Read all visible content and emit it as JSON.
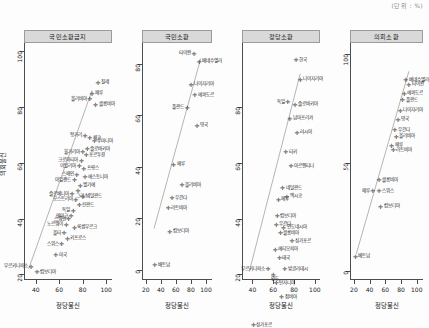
{
  "figure": {
    "corner_note": "(단위 : %)",
    "ylabel": "의회불신",
    "background": "#fdfdfd",
    "point_color": "#2b2b2b",
    "line_color": "#2b2b2b",
    "strip_fill": "#d9d9d9"
  },
  "chart_data": {
    "type": "scatter",
    "title": "",
    "xlabel": "정당불신",
    "ylabel": "의회불신",
    "grid": false,
    "legend": "none",
    "panels": [
      {
        "strip_label": "국민소환금지",
        "xlabel": "정당불신",
        "ylabel": "의회불신",
        "xlim": [
          30,
          105
        ],
        "ylim": [
          18,
          103
        ],
        "xticks": [
          40,
          60,
          80,
          100
        ],
        "yticks": [
          20,
          40,
          60,
          80,
          100
        ],
        "fit_line": {
          "x0": 34,
          "y0": 22,
          "x1": 88,
          "y1": 86
        },
        "points": [
          {
            "label": "칠레",
            "x": 93,
            "y": 89,
            "pos": "r"
          },
          {
            "label": "페루",
            "x": 88,
            "y": 85,
            "pos": "r"
          },
          {
            "label": "볼리비아",
            "x": 86,
            "y": 83,
            "pos": "l"
          },
          {
            "label": "콜롬비아",
            "x": 91,
            "y": 81,
            "pos": "r"
          },
          {
            "label": "헝가리",
            "x": 82,
            "y": 70,
            "pos": "l"
          },
          {
            "label": "체코",
            "x": 86,
            "y": 69,
            "pos": "r"
          },
          {
            "label": "루마니아",
            "x": 90,
            "y": 68,
            "pos": "r"
          },
          {
            "label": "슬로바키아",
            "x": 84,
            "y": 65,
            "pos": "r"
          },
          {
            "label": "불가리아",
            "x": 80,
            "y": 64,
            "pos": "l"
          },
          {
            "label": "포르투갈",
            "x": 83,
            "y": 63,
            "pos": "r"
          },
          {
            "label": "크로아티아",
            "x": 79,
            "y": 61,
            "pos": "l"
          },
          {
            "label": "이탈리아",
            "x": 77,
            "y": 59,
            "pos": "l"
          },
          {
            "label": "프랑스",
            "x": 81,
            "y": 58,
            "pos": "r"
          },
          {
            "label": "스페인",
            "x": 75,
            "y": 56,
            "pos": "l"
          },
          {
            "label": "에스토니아",
            "x": 82,
            "y": 55,
            "pos": "r"
          },
          {
            "label": "아일랜드",
            "x": 73,
            "y": 54,
            "pos": "l"
          },
          {
            "label": "벨기에",
            "x": 78,
            "y": 52,
            "pos": "r"
          },
          {
            "label": "그리스",
            "x": 76,
            "y": 50,
            "pos": "b"
          },
          {
            "label": "슬로베니아",
            "x": 71,
            "y": 49,
            "pos": "l"
          },
          {
            "label": "네덜란드",
            "x": 80,
            "y": 48,
            "pos": "r"
          },
          {
            "label": "오스트리아",
            "x": 74,
            "y": 47,
            "pos": "l"
          },
          {
            "label": "핀란드",
            "x": 77,
            "y": 45,
            "pos": "r"
          },
          {
            "label": "독일",
            "x": 72,
            "y": 43,
            "pos": "l"
          },
          {
            "label": "덴마크",
            "x": 70,
            "y": 41,
            "pos": "l"
          },
          {
            "label": "스웨덴",
            "x": 68,
            "y": 40,
            "pos": "l"
          },
          {
            "label": "노르웨이",
            "x": 66,
            "y": 38,
            "pos": "l"
          },
          {
            "label": "룩셈부르크",
            "x": 73,
            "y": 37,
            "pos": "r"
          },
          {
            "label": "몰타",
            "x": 64,
            "y": 35,
            "pos": "l"
          },
          {
            "label": "키프로스",
            "x": 67,
            "y": 33,
            "pos": "r"
          },
          {
            "label": "스위스",
            "x": 62,
            "y": 31,
            "pos": "l"
          },
          {
            "label": "미국",
            "x": 57,
            "y": 27,
            "pos": "r"
          },
          {
            "label": "부르키나파소",
            "x": 36,
            "y": 23,
            "pos": "l"
          },
          {
            "label": "캄보디아",
            "x": 41,
            "y": 21,
            "pos": "r"
          }
        ]
      },
      {
        "strip_label": "국민소환",
        "xlabel": "정당불신",
        "ylabel": "의회불신",
        "xlim": [
          15,
          108
        ],
        "ylim": [
          -4,
          88
        ],
        "xticks": [
          20,
          40,
          60,
          80,
          100
        ],
        "yticks": [
          0,
          20,
          40,
          60,
          80
        ],
        "fit_line": {
          "x0": 31,
          "y0": 16,
          "x1": 93,
          "y1": 82
        },
        "points": [
          {
            "label": "타이완",
            "x": 84,
            "y": 84,
            "pos": "l"
          },
          {
            "label": "베네수엘라",
            "x": 91,
            "y": 81,
            "pos": "r"
          },
          {
            "label": "나이지리아",
            "x": 80,
            "y": 72,
            "pos": "r"
          },
          {
            "label": "에콰도르",
            "x": 85,
            "y": 68,
            "pos": "r"
          },
          {
            "label": "폴란드",
            "x": 75,
            "y": 63,
            "pos": "l"
          },
          {
            "label": "영국",
            "x": 88,
            "y": 56,
            "pos": "r"
          },
          {
            "label": "페루",
            "x": 57,
            "y": 41,
            "pos": "r"
          },
          {
            "label": "볼리비아",
            "x": 68,
            "y": 33,
            "pos": "r"
          },
          {
            "label": "우간다",
            "x": 55,
            "y": 28,
            "pos": "r"
          },
          {
            "label": "라트비아",
            "x": 50,
            "y": 24,
            "pos": "r"
          },
          {
            "label": "캄보디아",
            "x": 52,
            "y": 15,
            "pos": "r"
          },
          {
            "label": "베트남",
            "x": 32,
            "y": 2,
            "pos": "r"
          }
        ]
      },
      {
        "strip_label": "정당소환",
        "xlabel": "정당불신",
        "ylabel": "의회불신",
        "xlim": [
          30,
          105
        ],
        "ylim": [
          18,
          103
        ],
        "xticks": [
          40,
          60,
          80,
          100
        ],
        "yticks": [
          20,
          40,
          60,
          80
        ],
        "fit_line": {
          "x0": 37,
          "y0": 21,
          "x1": 86,
          "y1": 92
        },
        "points": [
          {
            "label": "한국",
            "x": 82,
            "y": 97,
            "pos": "r"
          },
          {
            "label": "나이지리아",
            "x": 86,
            "y": 90,
            "pos": "r"
          },
          {
            "label": "독일",
            "x": 74,
            "y": 82,
            "pos": "l"
          },
          {
            "label": "슬로바키아",
            "x": 81,
            "y": 81,
            "pos": "r"
          },
          {
            "label": "남아프리카",
            "x": 76,
            "y": 76,
            "pos": "r"
          },
          {
            "label": "러시아",
            "x": 83,
            "y": 71,
            "pos": "r"
          },
          {
            "label": "터키",
            "x": 72,
            "y": 64,
            "pos": "r"
          },
          {
            "label": "아르헨티나",
            "x": 77,
            "y": 59,
            "pos": "r"
          },
          {
            "label": "네덜란드",
            "x": 69,
            "y": 51,
            "pos": "r"
          },
          {
            "label": "페루",
            "x": 65,
            "y": 47,
            "pos": "r"
          },
          {
            "label": "멕시코",
            "x": 73,
            "y": 48,
            "pos": "r"
          },
          {
            "label": "캄보디아",
            "x": 64,
            "y": 41,
            "pos": "r"
          },
          {
            "label": "우간다",
            "x": 63,
            "y": 38,
            "pos": "r"
          },
          {
            "label": "인도네시아",
            "x": 70,
            "y": 37,
            "pos": "r"
          },
          {
            "label": "콜롬비아",
            "x": 67,
            "y": 35,
            "pos": "r"
          },
          {
            "label": "싱가포르",
            "x": 78,
            "y": 32,
            "pos": "r"
          },
          {
            "label": "에티오피아",
            "x": 62,
            "y": 29,
            "pos": "r"
          },
          {
            "label": "태국",
            "x": 66,
            "y": 26,
            "pos": "r"
          },
          {
            "label": "부르키나파소",
            "x": 55,
            "y": 22,
            "pos": "l"
          },
          {
            "label": "방글라데시",
            "x": 71,
            "y": 22,
            "pos": "r"
          },
          {
            "label": "인도",
            "x": 60,
            "y": 20,
            "pos": "b"
          },
          {
            "label": "탄자니아",
            "x": 63,
            "y": 17,
            "pos": "r"
          },
          {
            "label": "잠비아",
            "x": 68,
            "y": 12,
            "pos": "r"
          },
          {
            "label": "싱가포르",
            "x": 41,
            "y": 2,
            "pos": "r"
          }
        ]
      },
      {
        "strip_label": "의회소환",
        "xlabel": "정당불신",
        "ylabel": "의회불신",
        "xlim": [
          15,
          108
        ],
        "ylim": [
          -4,
          105
        ],
        "xticks": [
          20,
          40,
          60,
          80,
          100
        ],
        "yticks": [
          0,
          50,
          100
        ],
        "fit_line": {
          "x0": 23,
          "y0": 8,
          "x1": 90,
          "y1": 92
        },
        "points": [
          {
            "label": "베네수엘라",
            "x": 86,
            "y": 88,
            "pos": "r"
          },
          {
            "label": "타이완",
            "x": 90,
            "y": 86,
            "pos": "r"
          },
          {
            "label": "에콰도르",
            "x": 84,
            "y": 82,
            "pos": "r"
          },
          {
            "label": "폴란드",
            "x": 82,
            "y": 79,
            "pos": "r"
          },
          {
            "label": "나이지리아",
            "x": 79,
            "y": 74,
            "pos": "r"
          },
          {
            "label": "영국",
            "x": 76,
            "y": 70,
            "pos": "r"
          },
          {
            "label": "우간다",
            "x": 72,
            "y": 65,
            "pos": "r"
          },
          {
            "label": "볼리비아",
            "x": 74,
            "y": 62,
            "pos": "r"
          },
          {
            "label": "페루",
            "x": 68,
            "y": 58,
            "pos": "r"
          },
          {
            "label": "라트비아",
            "x": 70,
            "y": 56,
            "pos": "r"
          },
          {
            "label": "콜롬비아",
            "x": 52,
            "y": 42,
            "pos": "r"
          },
          {
            "label": "페루",
            "x": 44,
            "y": 37,
            "pos": "l"
          },
          {
            "label": "스위스",
            "x": 52,
            "y": 37,
            "pos": "r"
          },
          {
            "label": "캄보디아",
            "x": 54,
            "y": 30,
            "pos": "r"
          },
          {
            "label": "베트남",
            "x": 22,
            "y": 7,
            "pos": "r"
          }
        ]
      }
    ]
  }
}
